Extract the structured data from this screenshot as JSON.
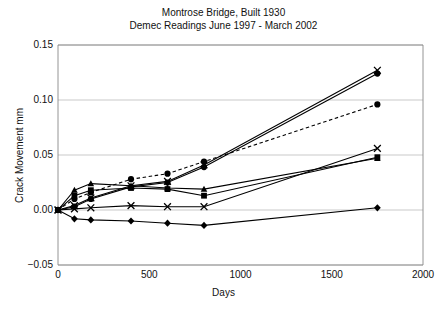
{
  "title": {
    "line1": "Montrose Bridge, Built 1930",
    "line2": "Demec Readings June 1997 - March 2002"
  },
  "chart_data": {
    "type": "line",
    "title": "Montrose Bridge, Built 1930\nDemec Readings June 1997 - March 2002",
    "xlabel": "Days",
    "ylabel": "Crack Movement mm",
    "xlim": [
      0,
      2000
    ],
    "ylim": [
      -0.05,
      0.15
    ],
    "xticks": [
      0,
      500,
      1000,
      1500,
      2000
    ],
    "yticks": [
      -0.05,
      0.0,
      0.05,
      0.1,
      0.15
    ],
    "ytick_labels": [
      "-0.05",
      "0.00",
      "0.05",
      "0.10",
      "0.15"
    ],
    "xtick_labels": [
      "0",
      "500",
      "1000",
      "1500",
      "2000"
    ],
    "grid": "horizontal",
    "legend": "none",
    "series": [
      {
        "name": "series-1-cross-top",
        "marker": "x",
        "linestyle": "solid",
        "x": [
          0,
          90,
          180,
          400,
          600,
          800,
          1750
        ],
        "y": [
          0.0,
          0.004,
          0.011,
          0.022,
          0.026,
          0.041,
          0.127
        ]
      },
      {
        "name": "series-2-circle-top",
        "marker": "circle",
        "linestyle": "solid",
        "x": [
          0,
          90,
          180,
          400,
          600,
          800,
          1750
        ],
        "y": [
          0.0,
          0.003,
          0.01,
          0.021,
          0.025,
          0.039,
          0.124
        ]
      },
      {
        "name": "series-3-circle-dashed",
        "marker": "circle",
        "linestyle": "dashed",
        "x": [
          0,
          90,
          180,
          400,
          600,
          800,
          1750
        ],
        "y": [
          0.0,
          0.01,
          0.016,
          0.028,
          0.033,
          0.044,
          0.096
        ]
      },
      {
        "name": "series-4-square",
        "marker": "square",
        "linestyle": "solid",
        "x": [
          0,
          90,
          180,
          400,
          600,
          800,
          1750
        ],
        "y": [
          0.0,
          0.013,
          0.018,
          0.02,
          0.019,
          0.013,
          0.048
        ]
      },
      {
        "name": "series-5-triangle",
        "marker": "triangle",
        "linestyle": "solid",
        "x": [
          0,
          90,
          180,
          400,
          600,
          800,
          1750
        ],
        "y": [
          0.0,
          0.018,
          0.024,
          0.022,
          0.02,
          0.019,
          0.047
        ]
      },
      {
        "name": "series-6-cross-mid",
        "marker": "x",
        "linestyle": "solid",
        "x": [
          0,
          90,
          180,
          400,
          600,
          800,
          1750
        ],
        "y": [
          0.0,
          0.001,
          0.002,
          0.004,
          0.003,
          0.003,
          0.056
        ]
      },
      {
        "name": "series-7-diamond-low",
        "marker": "diamond",
        "linestyle": "solid",
        "x": [
          0,
          90,
          180,
          400,
          600,
          800,
          1750
        ],
        "y": [
          0.0,
          -0.008,
          -0.009,
          -0.01,
          -0.012,
          -0.014,
          0.002
        ]
      }
    ]
  }
}
